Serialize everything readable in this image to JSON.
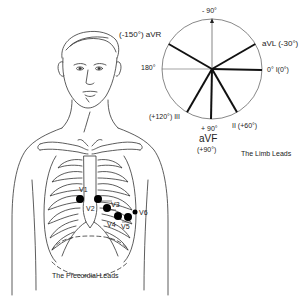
{
  "limb_leads": {
    "caption": "The Limb Leads",
    "top_label": "- 90°",
    "left_label": "180°",
    "bottom_label": "+ 90°",
    "avr_label": "(-150°) aVR",
    "avl_label": "aVL (-30°)",
    "lead_i_label": "0° I(0°)",
    "lead_iii_label": "(+120°) III",
    "lead_ii_label": "II (+60°)",
    "avf_label": "aVF",
    "avf_angle": "(+90°)",
    "leads": [
      {
        "name": "aVR",
        "angle": -150
      },
      {
        "name": "aVL",
        "angle": -30
      },
      {
        "name": "I",
        "angle": 0
      },
      {
        "name": "II",
        "angle": 60
      },
      {
        "name": "aVF",
        "angle": 90
      },
      {
        "name": "III",
        "angle": 120
      }
    ]
  },
  "precordial_leads": {
    "caption": "The Precordial Leads",
    "electrodes": [
      {
        "name": "V1",
        "label": "V1"
      },
      {
        "name": "V2",
        "label": "V2"
      },
      {
        "name": "V3",
        "label": "V3"
      },
      {
        "name": "V4",
        "label": "V4"
      },
      {
        "name": "V5",
        "label": "V5"
      },
      {
        "name": "V6",
        "label": "V6"
      }
    ]
  }
}
